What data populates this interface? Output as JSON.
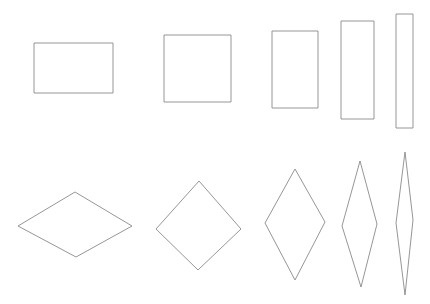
{
  "figure": {
    "background_color": "#ffffff",
    "stroke_color": "#8a8a8a",
    "stroke_width": 0.9,
    "fill": "none",
    "width": 430,
    "height": 304,
    "rows": [
      {
        "name": "rectangles-row",
        "label": "Rectangles row",
        "shape_type": "rectangle",
        "count": 5
      },
      {
        "name": "rhombi-row",
        "label": "Rhombi row",
        "shape_type": "rhombus",
        "count": 5
      }
    ]
  },
  "shapes": {
    "rectangles": [
      {
        "name": "rectangle-1",
        "label": "Wide rectangle",
        "x": 34,
        "y": 43,
        "width": 79,
        "height": 50,
        "aspect_ratio": "1.58"
      },
      {
        "name": "rectangle-2",
        "label": "Square",
        "x": 164,
        "y": 35,
        "width": 67,
        "height": 67,
        "aspect_ratio": "1.00"
      },
      {
        "name": "rectangle-3",
        "label": "Tall rectangle",
        "x": 272,
        "y": 31,
        "width": 46,
        "height": 77,
        "aspect_ratio": "0.60"
      },
      {
        "name": "rectangle-4",
        "label": "Narrow tall rectangle",
        "x": 341,
        "y": 21,
        "width": 33,
        "height": 98,
        "aspect_ratio": "0.34"
      },
      {
        "name": "rectangle-5",
        "label": "Sliver rectangle",
        "x": 396,
        "y": 14,
        "width": 17,
        "height": 114,
        "aspect_ratio": "0.15"
      }
    ],
    "rhombi": [
      {
        "name": "rhombus-1",
        "label": "Flat rhombus",
        "points": "75,192 132,226 76,257 18,226",
        "top": [
          75,
          192
        ],
        "right": [
          132,
          226
        ],
        "bottom": [
          76,
          257
        ],
        "left": [
          18,
          226
        ],
        "diagonal_h": 114,
        "diagonal_v": 65
      },
      {
        "name": "rhombus-2",
        "label": "Square rhombus",
        "points": "199,181 241,229 198,270 156,229",
        "top": [
          199,
          181
        ],
        "right": [
          241,
          229
        ],
        "bottom": [
          198,
          270
        ],
        "left": [
          156,
          229
        ],
        "diagonal_h": 85,
        "diagonal_v": 89
      },
      {
        "name": "rhombus-3",
        "label": "Tall rhombus",
        "points": "295,169 325,222 295,280 265,223",
        "top": [
          295,
          169
        ],
        "right": [
          325,
          222
        ],
        "bottom": [
          295,
          280
        ],
        "left": [
          265,
          223
        ],
        "diagonal_h": 60,
        "diagonal_v": 111
      },
      {
        "name": "rhombus-4",
        "label": "Narrow tall rhombus",
        "points": "360,161 377,224 361,287 342,226",
        "top": [
          360,
          161
        ],
        "right": [
          377,
          224
        ],
        "bottom": [
          361,
          287
        ],
        "left": [
          342,
          226
        ],
        "diagonal_h": 35,
        "diagonal_v": 126
      },
      {
        "name": "rhombus-5",
        "label": "Sliver rhombus",
        "points": "405,152 413,220 405,295 396,223",
        "top": [
          405,
          152
        ],
        "right": [
          413,
          220
        ],
        "bottom": [
          405,
          295
        ],
        "left": [
          396,
          223
        ],
        "diagonal_h": 17,
        "diagonal_v": 143
      }
    ]
  }
}
